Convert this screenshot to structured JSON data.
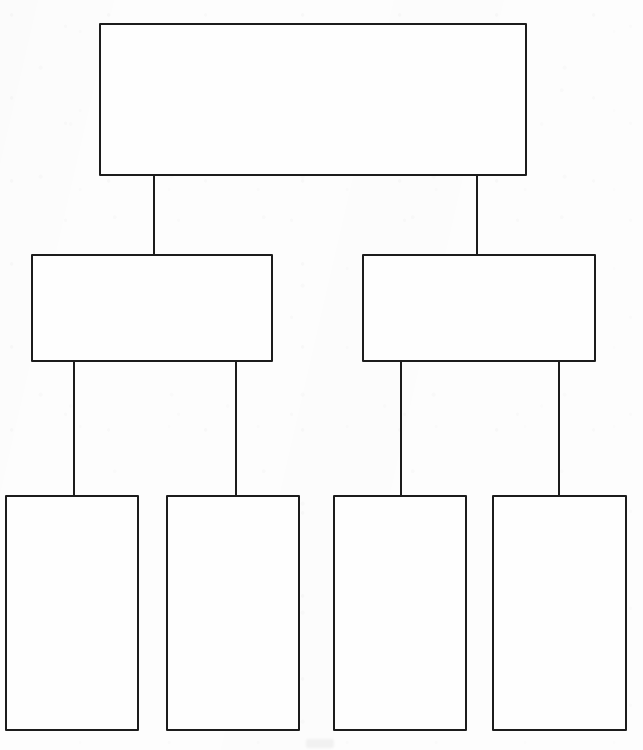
{
  "document": {
    "title": "Blank Hierarchy Diagram",
    "kind": "organizational-chart-template",
    "state": "blank",
    "page_width": 643,
    "page_height": 750,
    "background_color": "#fdfdfd",
    "line_color": "#1c1c1c",
    "box_fill_color": "#fefefe",
    "line_width": 2
  },
  "chart_data": {
    "type": "diagram",
    "diagram_type": "tree",
    "orientation": "top-down",
    "title": "",
    "levels": 3,
    "node_count": 7,
    "edge_count": 6,
    "nodes": [
      {
        "id": "n0",
        "level": 0,
        "label": "",
        "x": 99,
        "y": 23,
        "width": 428,
        "height": 153
      },
      {
        "id": "n1",
        "level": 1,
        "label": "",
        "x": 31,
        "y": 254,
        "width": 242,
        "height": 108
      },
      {
        "id": "n2",
        "level": 1,
        "label": "",
        "x": 362,
        "y": 254,
        "width": 234,
        "height": 108
      },
      {
        "id": "n3",
        "level": 2,
        "label": "",
        "x": 5,
        "y": 495,
        "width": 134,
        "height": 236
      },
      {
        "id": "n4",
        "level": 2,
        "label": "",
        "x": 166,
        "y": 495,
        "width": 134,
        "height": 236
      },
      {
        "id": "n5",
        "level": 2,
        "label": "",
        "x": 333,
        "y": 495,
        "width": 134,
        "height": 236
      },
      {
        "id": "n6",
        "level": 2,
        "label": "",
        "x": 492,
        "y": 495,
        "width": 135,
        "height": 236
      }
    ],
    "edges": [
      {
        "id": "e0",
        "from": "n0",
        "to": "n1",
        "x": 153,
        "y_top": 176,
        "y_bottom": 254
      },
      {
        "id": "e1",
        "from": "n0",
        "to": "n2",
        "x": 476,
        "y_top": 176,
        "y_bottom": 254
      },
      {
        "id": "e2",
        "from": "n1",
        "to": "n3",
        "x": 73,
        "y_top": 362,
        "y_bottom": 495
      },
      {
        "id": "e3",
        "from": "n1",
        "to": "n4",
        "x": 235,
        "y_top": 362,
        "y_bottom": 495
      },
      {
        "id": "e4",
        "from": "n2",
        "to": "n5",
        "x": 400,
        "y_top": 362,
        "y_bottom": 495
      },
      {
        "id": "e5",
        "from": "n2",
        "to": "n6",
        "x": 558,
        "y_top": 362,
        "y_bottom": 495
      }
    ]
  }
}
